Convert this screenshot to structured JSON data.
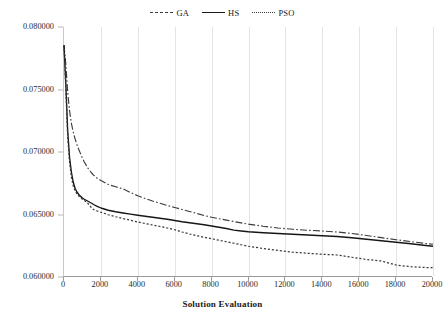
{
  "chart_data": {
    "type": "line",
    "title": "",
    "xlabel": "Solution Evaluation",
    "ylabel": "",
    "xlim": [
      0,
      20000
    ],
    "ylim": [
      0.06,
      0.08
    ],
    "grid": "vertical-only",
    "legend_position": "top-center",
    "x_ticks": [
      "0",
      "2000",
      "4000",
      "6000",
      "8000",
      "10000",
      "12000",
      "14000",
      "16000",
      "18000",
      "20000"
    ],
    "y_ticks": [
      "0.060000",
      "0.065000",
      "0.070000",
      "0.075000",
      "0.080000"
    ],
    "x": [
      0,
      100,
      200,
      300,
      400,
      500,
      600,
      700,
      800,
      900,
      1000,
      1100,
      1200,
      1300,
      1400,
      1500,
      1600,
      1800,
      2000,
      2400,
      2800,
      3200,
      3600,
      4000,
      4400,
      4800,
      5200,
      5600,
      6000,
      6400,
      6800,
      7200,
      7600,
      8000,
      8400,
      8800,
      9200,
      9600,
      10000,
      10800,
      11600,
      12400,
      13200,
      14000,
      14800,
      15600,
      16400,
      17200,
      18000,
      18800,
      19600,
      20000
    ],
    "series": [
      {
        "name": "GA",
        "style": "dash-dot",
        "color": "#3b3b3b",
        "values": [
          0.07855,
          0.077,
          0.0748,
          0.0733,
          0.0723,
          0.0716,
          0.07105,
          0.0706,
          0.0702,
          0.06985,
          0.0695,
          0.0692,
          0.06895,
          0.0687,
          0.0685,
          0.06832,
          0.06815,
          0.0679,
          0.06772,
          0.0674,
          0.06722,
          0.06705,
          0.06676,
          0.0665,
          0.06628,
          0.06608,
          0.0659,
          0.06572,
          0.06556,
          0.0654,
          0.06524,
          0.06508,
          0.06492,
          0.06478,
          0.06466,
          0.06455,
          0.06444,
          0.06433,
          0.06423,
          0.06406,
          0.06392,
          0.06382,
          0.06374,
          0.06368,
          0.0636,
          0.06348,
          0.06332,
          0.06315,
          0.06298,
          0.06283,
          0.06268,
          0.06262
        ]
      },
      {
        "name": "HS",
        "style": "solid",
        "color": "#161616",
        "values": [
          0.07855,
          0.0754,
          0.0717,
          0.0696,
          0.0684,
          0.0676,
          0.0671,
          0.0668,
          0.0666,
          0.06645,
          0.06632,
          0.06622,
          0.06614,
          0.06606,
          0.06598,
          0.0659,
          0.0658,
          0.06565,
          0.06552,
          0.06534,
          0.06522,
          0.06512,
          0.06503,
          0.06494,
          0.06486,
          0.06478,
          0.0647,
          0.06462,
          0.06452,
          0.06442,
          0.06434,
          0.06426,
          0.06418,
          0.06408,
          0.06398,
          0.06388,
          0.06375,
          0.06368,
          0.06362,
          0.06354,
          0.06348,
          0.06342,
          0.06336,
          0.0633,
          0.06324,
          0.06314,
          0.06302,
          0.0629,
          0.06278,
          0.06266,
          0.06252,
          0.06246
        ]
      },
      {
        "name": "PSO",
        "style": "dotted",
        "color": "#3b3b3b",
        "values": [
          0.07855,
          0.075,
          0.0712,
          0.0692,
          0.068,
          0.0673,
          0.0669,
          0.06665,
          0.06648,
          0.06634,
          0.06622,
          0.06612,
          0.06602,
          0.06588,
          0.0657,
          0.06552,
          0.0654,
          0.06528,
          0.06518,
          0.06498,
          0.06482,
          0.06468,
          0.06454,
          0.0644,
          0.06428,
          0.06416,
          0.06404,
          0.06392,
          0.06378,
          0.0636,
          0.06344,
          0.0633,
          0.06318,
          0.06306,
          0.06294,
          0.06282,
          0.0627,
          0.06258,
          0.06246,
          0.06228,
          0.06212,
          0.06198,
          0.0619,
          0.06182,
          0.06176,
          0.06158,
          0.0614,
          0.06128,
          0.06096,
          0.06082,
          0.06076,
          0.06074
        ]
      }
    ]
  },
  "legend": {
    "items": [
      {
        "label": "GA"
      },
      {
        "label": "HS"
      },
      {
        "label": "PSO"
      }
    ]
  },
  "axis": {
    "x_title": "Solution Evaluation"
  }
}
